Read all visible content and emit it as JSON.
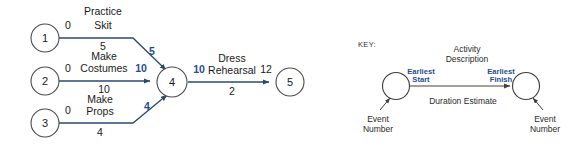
{
  "diagram": {
    "type": "pert-network-diagram",
    "colors": {
      "edge": "#2b4a6f",
      "highlight": "#1f4e8c",
      "node_stroke": "#4a4a4a",
      "key_edge": "#4a4239"
    },
    "nodes": [
      {
        "id": "n1",
        "label": "1",
        "cx": 45,
        "cy": 38,
        "r": 14
      },
      {
        "id": "n2",
        "label": "2",
        "cx": 45,
        "cy": 81,
        "r": 14
      },
      {
        "id": "n3",
        "label": "3",
        "cx": 45,
        "cy": 123,
        "r": 14
      },
      {
        "id": "n4",
        "label": "4",
        "cx": 172,
        "cy": 82,
        "r": 15
      },
      {
        "id": "n5",
        "label": "5",
        "cx": 290,
        "cy": 82,
        "r": 14
      }
    ],
    "activities": [
      {
        "id": "a1",
        "from": "1",
        "to": "4",
        "name_line1": "Practice",
        "name_line2": "Skit",
        "earliest_start": "0",
        "duration": "5",
        "earliest_finish": "5",
        "finish_is_highlighted": true
      },
      {
        "id": "a2",
        "from": "2",
        "to": "4",
        "name_line1": "Make",
        "name_line2": "Costumes",
        "earliest_start": "0",
        "duration": "10",
        "earliest_finish": "10",
        "finish_is_highlighted": true
      },
      {
        "id": "a3",
        "from": "3",
        "to": "4",
        "name_line1": "Make",
        "name_line2": "Props",
        "earliest_start": "0",
        "duration": "4",
        "earliest_finish": "4",
        "finish_is_highlighted": true
      },
      {
        "id": "a4",
        "from": "4",
        "to": "5",
        "name_line1": "Dress",
        "name_line2": "Rehearsal",
        "earliest_start": "10",
        "duration": "2",
        "earliest_finish": "12",
        "finish_is_highlighted": false
      }
    ]
  },
  "key": {
    "title": "KEY:",
    "activity_description_line1": "Activity",
    "activity_description_line2": "Description",
    "earliest_start_line1": "Earliest",
    "earliest_start_line2": "Start",
    "earliest_finish_line1": "Earliest",
    "earliest_finish_line2": "Finish",
    "duration_estimate": "Duration Estimate",
    "event_number_left_line1": "Event",
    "event_number_left_line2": "Number",
    "event_number_right_line1": "Event",
    "event_number_right_line2": "Number"
  }
}
